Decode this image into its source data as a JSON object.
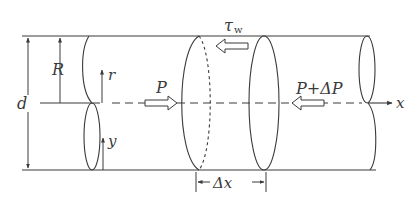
{
  "diagram": {
    "labels": {
      "radius": "R",
      "diameter": "d",
      "radial_axis": "r",
      "wall_axis": "y",
      "axial_axis": "x",
      "wall_shear": "τ",
      "wall_shear_subscript": "w",
      "pressure_left": "P",
      "pressure_right": "P+ΔP",
      "element_length": "Δx"
    },
    "colors": {
      "stroke": "#3a3a3a",
      "background": "#ffffff"
    }
  }
}
